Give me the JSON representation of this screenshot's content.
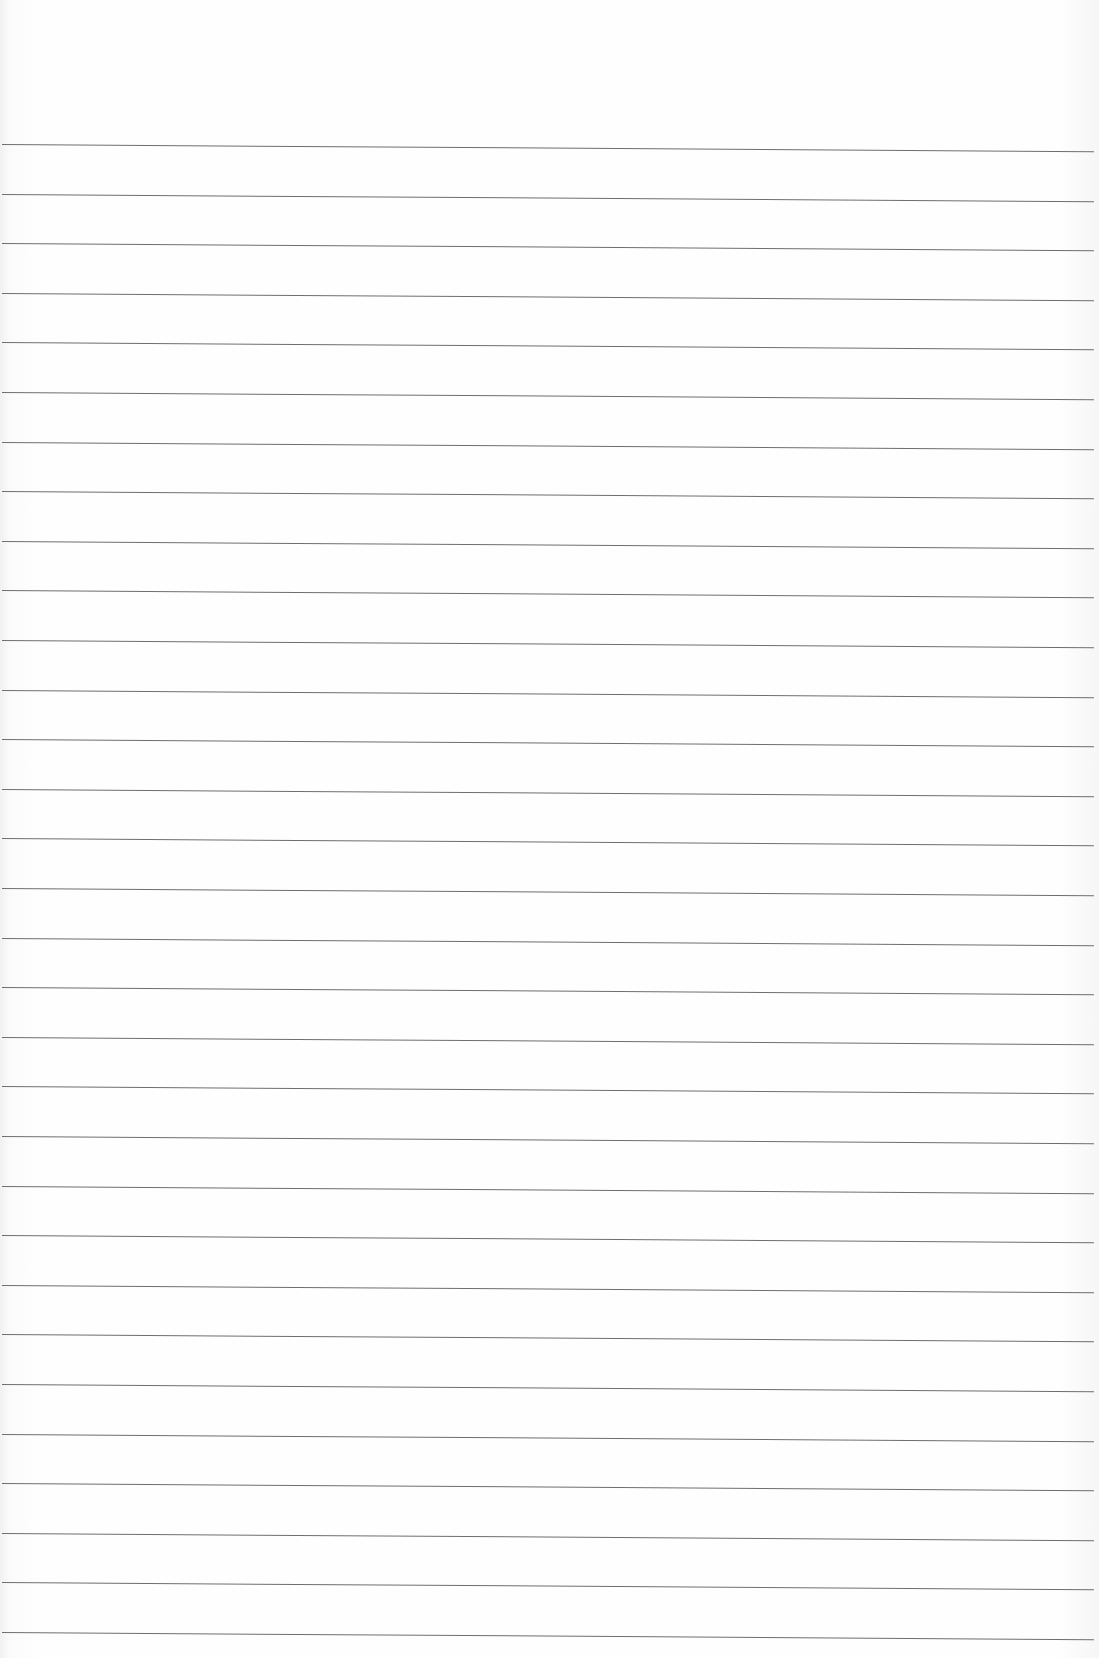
{
  "document": {
    "type": "lined-paper",
    "bleed_through_text": "",
    "rule_color": "#6e6e6e",
    "paper_color": "#fdfdfd",
    "rule_count": 31,
    "first_rule_y": 144,
    "rule_spacing": 49.6
  }
}
